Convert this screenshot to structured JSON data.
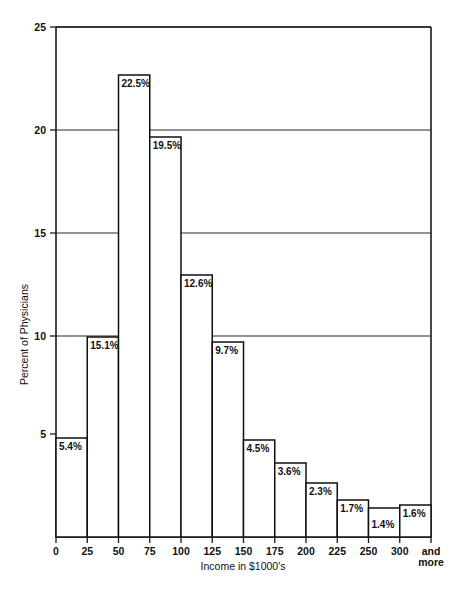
{
  "chart_data": {
    "type": "bar",
    "title": "",
    "xlabel": "Income in $1000's",
    "ylabel": "Percent of Physicians",
    "ylim": [
      0,
      25
    ],
    "grid": true,
    "legend": "none",
    "y_ticks": [
      "5",
      "10",
      "15",
      "20",
      "25"
    ],
    "y_tick_values": [
      5,
      10,
      15,
      20,
      25
    ],
    "x_tick_labels": [
      "0",
      "25",
      "50",
      "75",
      "100",
      "125",
      "150",
      "175",
      "200",
      "225",
      "250",
      "300",
      "and more"
    ],
    "categories": [
      "0-25",
      "25-50",
      "50-75",
      "75-100",
      "100-125",
      "125-150",
      "150-175",
      "175-200",
      "200-225",
      "225-250",
      "250-300",
      "300 and more"
    ],
    "values": [
      5.4,
      15.1,
      22.5,
      19.5,
      12.6,
      9.7,
      4.5,
      3.6,
      2.3,
      1.7,
      1.4,
      1.6
    ],
    "data_labels": [
      "5.4%",
      "15.1%",
      "22.5%",
      "19.5%",
      "12.6%",
      "9.7%",
      "4.5%",
      "3.6%",
      "2.3%",
      "1.7%",
      "1.4%",
      "1.6%"
    ],
    "bar_tops_px": [
      438,
      337,
      75,
      137,
      275,
      342,
      440,
      463,
      483,
      500,
      508,
      505
    ],
    "label_offsets_px": [
      12,
      12,
      12,
      12,
      12,
      12,
      12,
      12,
      12,
      12,
      20,
      12
    ]
  },
  "axes": {
    "x_label_and_more_line1": "and",
    "x_label_and_more_line2": "more"
  }
}
